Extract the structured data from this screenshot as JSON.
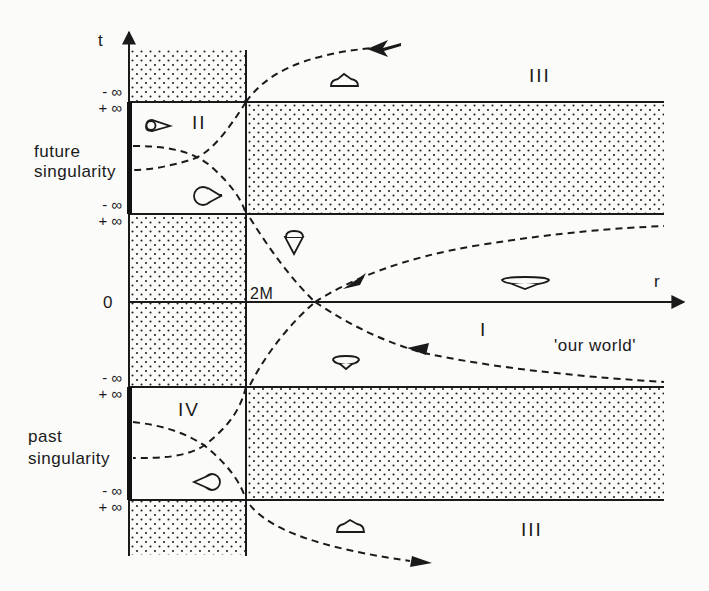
{
  "figure": {
    "type": "Schwarzschild spacetime in Schwarzschild coordinates (t, r)",
    "axes": {
      "t_label": "t",
      "r_label": "r",
      "origin_label": "0",
      "horizon_label": "2M"
    },
    "infinity_labels": {
      "minus": "- ∞",
      "plus": "+ ∞"
    },
    "regions": {
      "I": "I",
      "II": "II",
      "III": "III",
      "IV": "IV"
    },
    "annotations": {
      "our_world": "'our  world'",
      "future_singularity_line1": "future",
      "future_singularity_line2": "singularity",
      "past_singularity_line1": "past",
      "past_singularity_line2": "singularity"
    },
    "colors": {
      "ink": "#1a1a1a",
      "background": "#fbfbfa",
      "hatch_dot": "#222222"
    },
    "icons": [
      "light-cone-icon"
    ]
  }
}
